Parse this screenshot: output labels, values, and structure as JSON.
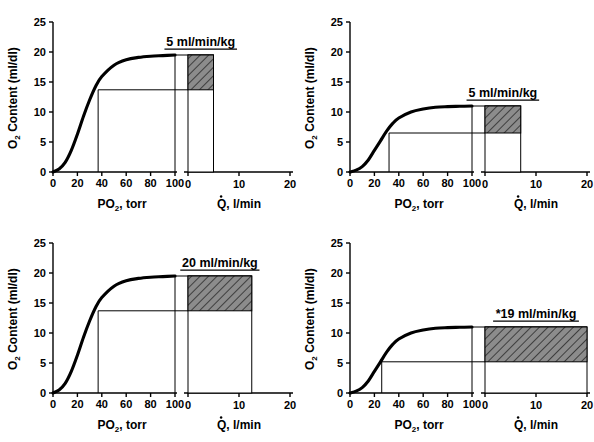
{
  "figure": {
    "layout": "2x2 grid of panels",
    "background_color": "#ffffff",
    "line_color": "#000000",
    "hatch_fill_color": "#8c8c8c"
  },
  "axes_common": {
    "y_label": "O",
    "y_label_sub": "2",
    "y_label_rest": " Content (ml/dl)",
    "y_ticks": [
      "0",
      "5",
      "10",
      "15",
      "20",
      "25"
    ],
    "y_min": 0,
    "y_max": 25,
    "x_left_label": "PO",
    "x_left_label_sub": "2",
    "x_left_label_rest": ", torr",
    "x_left_ticks": [
      "0",
      "20",
      "40",
      "60",
      "80",
      "100"
    ],
    "x_left_min": 0,
    "x_left_max": 100,
    "x_right_label": "Q, l/min",
    "x_right_label_dotted": "Q",
    "x_right_label_rest": ", l/min",
    "x_right_ticks": [
      "0",
      "10",
      "20"
    ],
    "x_right_min": 0,
    "x_right_max": 20
  },
  "panels": [
    {
      "id": "top-left",
      "name": "normal-rest",
      "box_label": "5 ml/min/kg",
      "arterial_content": 19.5,
      "venous_content": 13.7,
      "venous_po2": 37,
      "arterial_po2": 100,
      "cardiac_output": 5.0,
      "hill_p50": 27,
      "hill_n": 2.7,
      "plateau": 19.5
    },
    {
      "id": "top-right",
      "name": "anemia-rest",
      "box_label": "5 ml/min/kg",
      "arterial_content": 11.0,
      "venous_content": 6.5,
      "venous_po2": 32,
      "arterial_po2": 100,
      "cardiac_output": 7.0,
      "hill_p50": 27,
      "hill_n": 2.7,
      "plateau": 11.0
    },
    {
      "id": "bottom-left",
      "name": "normal-exercise",
      "box_label": "20 ml/min/kg",
      "arterial_content": 19.5,
      "venous_content": 13.7,
      "venous_po2": 37,
      "arterial_po2": 100,
      "cardiac_output": 12.5,
      "hill_p50": 27,
      "hill_n": 2.7,
      "plateau": 19.5
    },
    {
      "id": "bottom-right",
      "name": "anemia-exercise",
      "box_label": "*19 ml/min/kg",
      "arterial_content": 11.0,
      "venous_content": 5.2,
      "venous_po2": 26,
      "arterial_po2": 100,
      "cardiac_output": 20.0,
      "hill_p50": 27,
      "hill_n": 2.7,
      "plateau": 11.0
    }
  ],
  "chart_data": {
    "type": "line",
    "xlabel": "PO2, torr",
    "ylabel": "O2 Content (ml/dl)",
    "xlim": [
      0,
      100
    ],
    "ylim": [
      0,
      25
    ],
    "grid": false,
    "legend": "none",
    "secondary_axis": {
      "xlabel": "Q, l/min",
      "xlim": [
        0,
        20
      ],
      "xticks": [
        0,
        10,
        20
      ]
    },
    "xticks": [
      0,
      20,
      40,
      60,
      80,
      100
    ],
    "yticks": [
      0,
      5,
      10,
      15,
      20,
      25
    ],
    "panels": [
      {
        "panel": "top-left",
        "annotation": "5 ml/min/kg",
        "curve": {
          "x": [
            0,
            5,
            10,
            15,
            20,
            25,
            30,
            35,
            40,
            50,
            60,
            70,
            80,
            90,
            100
          ],
          "y": [
            0.0,
            0.5,
            1.6,
            3.6,
            6.3,
            9.3,
            12.0,
            14.3,
            15.9,
            17.8,
            18.7,
            19.1,
            19.3,
            19.4,
            19.5
          ]
        },
        "markers": {
          "arterial": {
            "po2": 100,
            "content": 19.5
          },
          "venous": {
            "po2": 37,
            "content": 13.7
          }
        },
        "box": {
          "q_from": 0,
          "q_to": 5.0,
          "content_from": 13.7,
          "content_to": 19.5
        }
      },
      {
        "panel": "top-right",
        "annotation": "5 ml/min/kg",
        "curve": {
          "x": [
            0,
            5,
            10,
            15,
            20,
            25,
            30,
            35,
            40,
            50,
            60,
            70,
            80,
            90,
            100
          ],
          "y": [
            0.0,
            0.3,
            0.9,
            2.0,
            3.6,
            5.2,
            6.8,
            8.1,
            9.0,
            10.0,
            10.5,
            10.8,
            10.9,
            10.95,
            11.0
          ]
        },
        "markers": {
          "arterial": {
            "po2": 100,
            "content": 11.0
          },
          "venous": {
            "po2": 32,
            "content": 6.5
          }
        },
        "box": {
          "q_from": 0,
          "q_to": 7.0,
          "content_from": 6.5,
          "content_to": 11.0
        }
      },
      {
        "panel": "bottom-left",
        "annotation": "20 ml/min/kg",
        "curve": {
          "x": [
            0,
            5,
            10,
            15,
            20,
            25,
            30,
            35,
            40,
            50,
            60,
            70,
            80,
            90,
            100
          ],
          "y": [
            0.0,
            0.5,
            1.6,
            3.6,
            6.3,
            9.3,
            12.0,
            14.3,
            15.9,
            17.8,
            18.7,
            19.1,
            19.3,
            19.4,
            19.5
          ]
        },
        "markers": {
          "arterial": {
            "po2": 100,
            "content": 19.5
          },
          "venous": {
            "po2": 37,
            "content": 13.7
          }
        },
        "box": {
          "q_from": 0,
          "q_to": 12.5,
          "content_from": 13.7,
          "content_to": 19.5
        }
      },
      {
        "panel": "bottom-right",
        "annotation": "*19 ml/min/kg",
        "curve": {
          "x": [
            0,
            5,
            10,
            15,
            20,
            25,
            30,
            35,
            40,
            50,
            60,
            70,
            80,
            90,
            100
          ],
          "y": [
            0.0,
            0.3,
            0.9,
            2.0,
            3.6,
            5.2,
            6.8,
            8.1,
            9.0,
            10.0,
            10.5,
            10.8,
            10.9,
            10.95,
            11.0
          ]
        },
        "markers": {
          "arterial": {
            "po2": 100,
            "content": 11.0
          },
          "venous": {
            "po2": 26,
            "content": 5.2
          }
        },
        "box": {
          "q_from": 0,
          "q_to": 20.0,
          "content_from": 5.2,
          "content_to": 11.0
        }
      }
    ]
  }
}
